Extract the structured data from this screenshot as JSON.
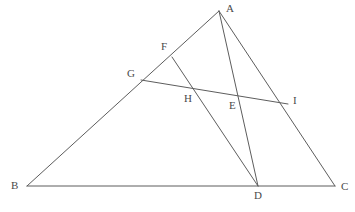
{
  "figure": {
    "type": "euclidean-geometry-diagram",
    "background_color": "#ffffff",
    "stroke_color": "#5d5d5d",
    "label_color": "#4a4a4a",
    "width": 355,
    "height": 212,
    "points": {
      "A": {
        "label": "A",
        "x": 219,
        "y": 11,
        "label_x": 226,
        "label_y": 3,
        "role": "triangle-apex"
      },
      "B": {
        "label": "B",
        "x": 27,
        "y": 186,
        "label_x": 11,
        "label_y": 180,
        "role": "triangle-vertex"
      },
      "C": {
        "label": "C",
        "x": 335,
        "y": 186,
        "label_x": 341,
        "label_y": 181,
        "role": "triangle-vertex"
      },
      "D": {
        "label": "D",
        "x": 258,
        "y": 186,
        "label_x": 254,
        "label_y": 190,
        "role": "point-on-bc"
      },
      "E": {
        "label": "E",
        "x": 237,
        "y": 98,
        "label_x": 229,
        "label_y": 100,
        "role": "intersection-ad-gi"
      },
      "F": {
        "label": "F",
        "x": 172,
        "y": 57,
        "label_x": 161,
        "label_y": 41,
        "role": "point-on-ab"
      },
      "G": {
        "label": "G",
        "x": 141,
        "y": 80,
        "label_x": 127,
        "label_y": 68,
        "role": "point-on-ab"
      },
      "H": {
        "label": "H",
        "x": 193,
        "y": 88,
        "label_x": 184,
        "label_y": 93,
        "role": "intersection-fd-gi"
      },
      "I": {
        "label": "I",
        "x": 288,
        "y": 104,
        "label_x": 293,
        "label_y": 95,
        "role": "point-on-ac"
      }
    },
    "segments": [
      {
        "name": "side-ab",
        "from": "A",
        "to": "B",
        "d": "M 219 11 L 27 186"
      },
      {
        "name": "side-bc",
        "from": "B",
        "to": "C",
        "d": "M 27 186 L 335 186"
      },
      {
        "name": "side-ca",
        "from": "C",
        "to": "A",
        "d": "M 335 186 L 219 11"
      },
      {
        "name": "cevian-ad",
        "from": "A",
        "to": "D",
        "d": "M 219 11 L 258 186"
      },
      {
        "name": "segment-fd",
        "from": "F",
        "to": "D",
        "d": "M 172 57 L 258 186"
      },
      {
        "name": "transversal-gi",
        "from": "G",
        "to": "I",
        "d": "M 141 80 L 288 104"
      }
    ]
  }
}
